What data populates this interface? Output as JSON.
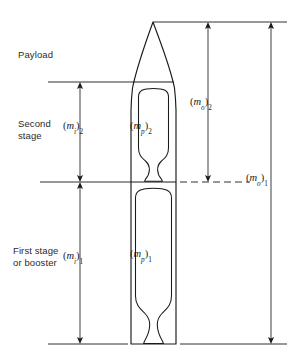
{
  "figure": {
    "background": "#ffffff",
    "line_color": "#1a1a1a",
    "text_color": "#2b2b2b",
    "width": 294,
    "height": 364
  },
  "stage_labels": [
    {
      "id": "payload",
      "lines": [
        "Payload"
      ],
      "x": 18,
      "y": 49
    },
    {
      "id": "second-stage",
      "lines": [
        "Second",
        "stage"
      ],
      "x": 18,
      "y": 118
    },
    {
      "id": "first-stage",
      "lines": [
        "First stage",
        "or booster"
      ],
      "x": 13,
      "y": 245
    }
  ],
  "mass_labels": [
    {
      "id": "inert-mass-stage-2",
      "symbol": "m",
      "sub_symbol": "i",
      "sub_number": "2",
      "text": "(mi)2",
      "x": 63,
      "y": 120
    },
    {
      "id": "propellant-mass-stage-2",
      "symbol": "m",
      "sub_symbol": "p",
      "sub_number": "2",
      "text": "(mp)2",
      "x": 130,
      "y": 120
    },
    {
      "id": "gross-mass-stage-2",
      "symbol": "m",
      "sub_symbol": "o",
      "sub_number": "2",
      "text": "(mo)2",
      "x": 190,
      "y": 96
    },
    {
      "id": "gross-mass-stage-1",
      "symbol": "m",
      "sub_symbol": "o",
      "sub_number": "1",
      "text": "(mo)1",
      "x": 246,
      "y": 172
    },
    {
      "id": "inert-mass-stage-1",
      "symbol": "m",
      "sub_symbol": "i",
      "sub_number": "1",
      "text": "(mi)1",
      "x": 63,
      "y": 250
    },
    {
      "id": "propellant-mass-stage-1",
      "symbol": "m",
      "sub_symbol": "p",
      "sub_number": "1",
      "text": "(mp)1",
      "x": 130,
      "y": 248
    }
  ],
  "reference_lines": [
    {
      "id": "top-datum",
      "y": 22,
      "x1": 153,
      "x2": 287,
      "style": "solid"
    },
    {
      "id": "payload-separation-datum",
      "y": 82,
      "x1": 48,
      "x2": 135,
      "style": "solid"
    },
    {
      "id": "interstage-datum-left",
      "y": 182,
      "x1": 40,
      "x2": 135,
      "style": "solid"
    },
    {
      "id": "interstage-datum-right",
      "y": 182,
      "x1": 180,
      "x2": 250,
      "style": "dashed"
    },
    {
      "id": "bottom-datum-left",
      "y": 344,
      "x1": 48,
      "x2": 128,
      "style": "solid"
    },
    {
      "id": "bottom-datum-right",
      "y": 344,
      "x1": 180,
      "x2": 287,
      "style": "solid"
    }
  ],
  "dimension_arrows": [
    {
      "id": "arrow-inert-mass-2",
      "x": 80,
      "y1": 82,
      "y2": 182
    },
    {
      "id": "arrow-inert-mass-1",
      "x": 80,
      "y1": 182,
      "y2": 344
    },
    {
      "id": "arrow-gross-mass-2",
      "x": 208,
      "y1": 22,
      "y2": 182
    },
    {
      "id": "arrow-gross-mass-1",
      "x": 271,
      "y1": 22,
      "y2": 344
    }
  ],
  "rocket": {
    "id": "two-stage-rocket-outline",
    "nose_tip_x": 153,
    "nose_tip_y": 22,
    "body_left_x": 131,
    "body_right_x": 176,
    "base_y": 344,
    "interstage_y": 182,
    "payload_separation_y": 82
  }
}
